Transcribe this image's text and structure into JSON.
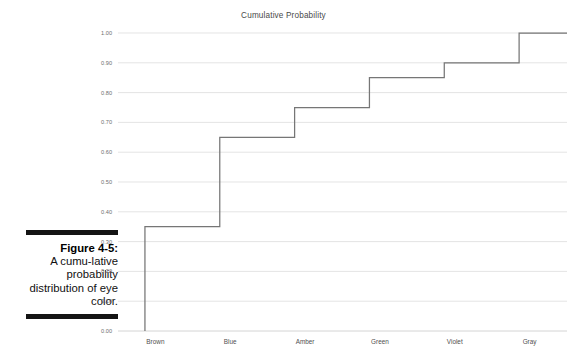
{
  "figure": {
    "caption_label": "Figure 4-5:",
    "caption_body": "A cumu-lative probability distribution of eye color.",
    "rule_color": "#141414"
  },
  "chart_data": {
    "type": "line",
    "title": "Cumulative Probability",
    "xlabel": "",
    "ylabel": "",
    "categories": [
      "Brown",
      "Blue",
      "Amber",
      "Green",
      "Violet",
      "Gray"
    ],
    "values": [
      0.35,
      0.65,
      0.75,
      0.85,
      0.9,
      1.0
    ],
    "step_style": "step-post",
    "ylim": [
      0.0,
      1.0
    ],
    "ytick_labels": [
      "0.00",
      "0.10",
      "0.20",
      "0.30",
      "0.40",
      "0.50",
      "0.60",
      "0.70",
      "0.80",
      "0.90",
      "1.00"
    ],
    "ytick_values": [
      0.0,
      0.1,
      0.2,
      0.3,
      0.4,
      0.5,
      0.6,
      0.7,
      0.8,
      0.9,
      1.0
    ],
    "grid": true,
    "grid_axis": "y",
    "legend": false,
    "legend_position": "none",
    "series_color": "#767676",
    "grid_color": "#d9d9d9",
    "title_color": "#4a4a4a"
  }
}
